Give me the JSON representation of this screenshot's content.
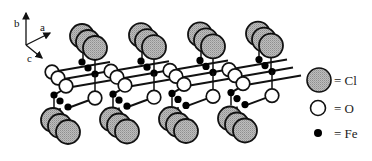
{
  "figure": {
    "type": "crystal-structure-diagram"
  },
  "axes": {
    "b": "b",
    "a": "a",
    "c": "c"
  },
  "legend": {
    "items": [
      {
        "symbol": "large-gray-hatched-circle",
        "label": "= Cl",
        "color": "#b8b8b8"
      },
      {
        "symbol": "white-circle",
        "label": "= O",
        "color": "#ffffff"
      },
      {
        "symbol": "small-black-dot",
        "label": "= Fe",
        "color": "#000000"
      }
    ]
  },
  "colors": {
    "cl_fill": "#b5b5b5",
    "o_fill": "#ffffff",
    "fe_fill": "#000000",
    "outline": "#111111"
  },
  "structure": {
    "columns": 4,
    "column_spacing_px": 59,
    "atoms_per_column_depth": 3
  }
}
